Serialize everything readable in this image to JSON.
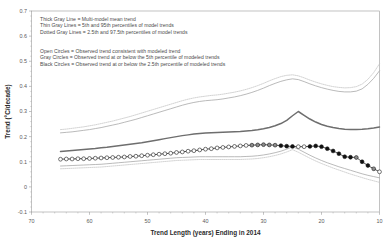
{
  "chart_data": {
    "type": "line",
    "title": "",
    "xlabel": "Trend Length (years) Ending in 2014",
    "ylabel": "Trend (°C/decade)",
    "xlim": [
      70,
      10
    ],
    "ylim": [
      -0.1,
      0.7
    ],
    "x_ticks": [
      70,
      60,
      50,
      40,
      30,
      20,
      10
    ],
    "x_tick_labels": [
      "70",
      "60",
      "50",
      "40",
      "30",
      "20",
      "10"
    ],
    "y_ticks": [
      -0.1,
      0,
      0.1,
      0.2,
      0.3,
      0.4,
      0.5,
      0.6,
      0.7
    ],
    "y_tick_labels": [
      "-0.1",
      "0",
      "0.1",
      "0.2",
      "0.3",
      "0.4",
      "0.5",
      "0.6",
      "0.7"
    ],
    "x_axis_reversed": true,
    "grid": false,
    "legend_position": "upper-left-inside",
    "colors": {
      "multi_model_mean": "#6e6e6e",
      "percentile_5_95": "#a8a8a8",
      "percentile_2p5_97p5": "#c0c0c0",
      "observed_line": "#1a1a1a",
      "open_circle_fill": "#ffffff",
      "gray_circle_fill": "#8c8c8c",
      "black_circle_fill": "#111111",
      "axis": "#9a9a9a",
      "text": "#3b3b3b"
    },
    "x": [
      65,
      64,
      63,
      62,
      61,
      60,
      59,
      58,
      57,
      56,
      55,
      54,
      53,
      52,
      51,
      50,
      49,
      48,
      47,
      46,
      45,
      44,
      43,
      42,
      41,
      40,
      39,
      38,
      37,
      36,
      35,
      34,
      33,
      32,
      31,
      30,
      29,
      28,
      27,
      26,
      25,
      24,
      23,
      22,
      21,
      20,
      19,
      18,
      17,
      16,
      15,
      14,
      13,
      12,
      11,
      10
    ],
    "series": [
      {
        "name": "Multi-model mean trend",
        "style": "thick-gray-line",
        "values": [
          0.141,
          0.143,
          0.145,
          0.147,
          0.149,
          0.151,
          0.153,
          0.156,
          0.158,
          0.161,
          0.164,
          0.167,
          0.17,
          0.173,
          0.176,
          0.18,
          0.184,
          0.188,
          0.192,
          0.196,
          0.2,
          0.204,
          0.207,
          0.21,
          0.212,
          0.214,
          0.215,
          0.216,
          0.217,
          0.218,
          0.219,
          0.22,
          0.222,
          0.224,
          0.227,
          0.231,
          0.236,
          0.243,
          0.252,
          0.265,
          0.283,
          0.3,
          0.285,
          0.27,
          0.258,
          0.248,
          0.241,
          0.236,
          0.232,
          0.229,
          0.228,
          0.228,
          0.229,
          0.231,
          0.234,
          0.238
        ]
      },
      {
        "name": "95th percentile of model trends",
        "style": "thin-gray-line",
        "values": [
          0.215,
          0.217,
          0.219,
          0.222,
          0.225,
          0.228,
          0.232,
          0.236,
          0.241,
          0.246,
          0.251,
          0.257,
          0.263,
          0.269,
          0.276,
          0.283,
          0.29,
          0.297,
          0.304,
          0.311,
          0.318,
          0.325,
          0.331,
          0.336,
          0.34,
          0.343,
          0.345,
          0.347,
          0.35,
          0.354,
          0.358,
          0.363,
          0.369,
          0.376,
          0.384,
          0.393,
          0.403,
          0.412,
          0.42,
          0.426,
          0.43,
          0.427,
          0.419,
          0.41,
          0.402,
          0.395,
          0.389,
          0.384,
          0.38,
          0.378,
          0.378,
          0.381,
          0.39,
          0.408,
          0.432,
          0.462
        ]
      },
      {
        "name": "5th percentile of model trends",
        "style": "thin-gray-line",
        "values": [
          0.083,
          0.084,
          0.085,
          0.086,
          0.087,
          0.088,
          0.089,
          0.09,
          0.092,
          0.094,
          0.096,
          0.098,
          0.1,
          0.102,
          0.104,
          0.106,
          0.108,
          0.11,
          0.112,
          0.114,
          0.116,
          0.117,
          0.118,
          0.119,
          0.12,
          0.12,
          0.12,
          0.12,
          0.12,
          0.12,
          0.12,
          0.12,
          0.121,
          0.122,
          0.124,
          0.127,
          0.131,
          0.136,
          0.142,
          0.15,
          0.16,
          0.15,
          0.138,
          0.126,
          0.115,
          0.105,
          0.096,
          0.088,
          0.08,
          0.073,
          0.066,
          0.059,
          0.052,
          0.046,
          0.041,
          0.036
        ]
      },
      {
        "name": "97.5th percentile of model trends",
        "style": "dotted-gray-line",
        "values": [
          0.228,
          0.23,
          0.233,
          0.236,
          0.239,
          0.243,
          0.247,
          0.252,
          0.257,
          0.262,
          0.268,
          0.274,
          0.28,
          0.287,
          0.294,
          0.301,
          0.308,
          0.315,
          0.322,
          0.329,
          0.336,
          0.343,
          0.349,
          0.354,
          0.358,
          0.361,
          0.364,
          0.366,
          0.369,
          0.373,
          0.377,
          0.382,
          0.388,
          0.395,
          0.403,
          0.412,
          0.422,
          0.431,
          0.439,
          0.444,
          0.446,
          0.442,
          0.434,
          0.425,
          0.417,
          0.41,
          0.404,
          0.399,
          0.396,
          0.394,
          0.395,
          0.399,
          0.409,
          0.428,
          0.455,
          0.49
        ]
      },
      {
        "name": "2.5th percentile of model trends",
        "style": "dotted-gray-line",
        "values": [
          0.072,
          0.073,
          0.074,
          0.075,
          0.076,
          0.077,
          0.078,
          0.079,
          0.081,
          0.083,
          0.085,
          0.087,
          0.089,
          0.091,
          0.093,
          0.095,
          0.097,
          0.099,
          0.101,
          0.103,
          0.105,
          0.106,
          0.107,
          0.108,
          0.109,
          0.109,
          0.109,
          0.109,
          0.109,
          0.109,
          0.109,
          0.109,
          0.11,
          0.111,
          0.113,
          0.116,
          0.12,
          0.125,
          0.131,
          0.139,
          0.148,
          0.138,
          0.126,
          0.114,
          0.103,
          0.093,
          0.084,
          0.075,
          0.067,
          0.059,
          0.051,
          0.044,
          0.037,
          0.03,
          0.024,
          0.018
        ]
      }
    ],
    "observed": {
      "name": "Observed trend",
      "x": [
        65,
        64,
        63,
        62,
        61,
        60,
        59,
        58,
        57,
        56,
        55,
        54,
        53,
        52,
        51,
        50,
        49,
        48,
        47,
        46,
        45,
        44,
        43,
        42,
        41,
        40,
        39,
        38,
        37,
        36,
        35,
        34,
        33,
        32,
        31,
        30,
        29,
        28,
        27,
        26,
        25,
        24,
        23,
        22,
        21,
        20,
        19,
        18,
        17,
        16,
        15,
        14,
        13,
        12,
        11,
        10
      ],
      "values": [
        0.11,
        0.111,
        0.111,
        0.112,
        0.112,
        0.113,
        0.114,
        0.115,
        0.116,
        0.117,
        0.118,
        0.119,
        0.121,
        0.122,
        0.124,
        0.126,
        0.128,
        0.13,
        0.132,
        0.134,
        0.137,
        0.139,
        0.142,
        0.144,
        0.147,
        0.15,
        0.152,
        0.155,
        0.157,
        0.159,
        0.161,
        0.163,
        0.165,
        0.166,
        0.167,
        0.168,
        0.167,
        0.166,
        0.164,
        0.162,
        0.161,
        0.16,
        0.16,
        0.161,
        0.163,
        0.16,
        0.152,
        0.143,
        0.132,
        0.12,
        0.118,
        0.117,
        0.1,
        0.085,
        0.072,
        0.06
      ],
      "marker_classes": [
        "open",
        "open",
        "open",
        "open",
        "open",
        "open",
        "open",
        "open",
        "open",
        "open",
        "open",
        "open",
        "open",
        "open",
        "open",
        "open",
        "open",
        "open",
        "open",
        "open",
        "open",
        "open",
        "open",
        "open",
        "open",
        "open",
        "open",
        "open",
        "open",
        "open",
        "open",
        "open",
        "open",
        "gray",
        "gray",
        "gray",
        "gray",
        "gray",
        "black",
        "black",
        "black",
        "open",
        "open",
        "black",
        "black",
        "black",
        "black",
        "black",
        "black",
        "black",
        "black",
        "gray",
        "black",
        "black",
        "gray",
        "open"
      ]
    }
  },
  "legend": {
    "models": [
      "Thick Gray Line = Multi-model mean trend",
      "Thin Gray Lines = 5th and 95th percentiles of model trends",
      "Dotted Gray Lines = 2.5th and 97.5th percentiles of model trends"
    ],
    "circles": [
      "Open Circles = Observed trend consistent with modeled trend",
      "Gray Circles = Observed trend at or below the 5th percentile of modeled trends",
      "Black Circles = Observed trend at or below the 2.5th percentile of modeled trends"
    ]
  }
}
